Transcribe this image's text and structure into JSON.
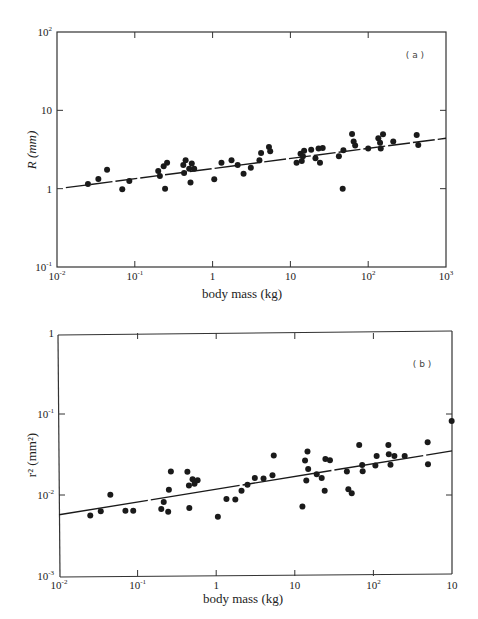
{
  "chart_data": [
    {
      "type": "scatter",
      "panel": "(a)",
      "title": "",
      "xlabel": "body mass (kg)",
      "ylabel": "R (mm)",
      "xscale": "log",
      "yscale": "log",
      "xlim": [
        0.01,
        1000
      ],
      "ylim": [
        0.1,
        100
      ],
      "x_tick_labels": [
        "10⁻²",
        "10⁻¹",
        "1",
        "10",
        "10²",
        "10³"
      ],
      "y_tick_labels": [
        "10⁻¹",
        "1",
        "10",
        "10²"
      ],
      "grid": false,
      "fit_line": {
        "x": [
          0.013,
          1000
        ],
        "y": [
          1.03,
          4.4
        ],
        "style": "dashed"
      },
      "points": [
        [
          0.025,
          1.15
        ],
        [
          0.034,
          1.33
        ],
        [
          0.044,
          1.75
        ],
        [
          0.069,
          0.98
        ],
        [
          0.085,
          1.25
        ],
        [
          0.2,
          1.68
        ],
        [
          0.21,
          1.45
        ],
        [
          0.235,
          1.93
        ],
        [
          0.245,
          1.0
        ],
        [
          0.26,
          2.15
        ],
        [
          0.42,
          2.0
        ],
        [
          0.43,
          1.58
        ],
        [
          0.45,
          2.3
        ],
        [
          0.5,
          1.8
        ],
        [
          0.52,
          1.2
        ],
        [
          0.54,
          2.1
        ],
        [
          0.58,
          1.8
        ],
        [
          1.05,
          1.32
        ],
        [
          1.3,
          2.15
        ],
        [
          1.75,
          2.3
        ],
        [
          2.1,
          2.0
        ],
        [
          2.5,
          1.55
        ],
        [
          3.1,
          1.85
        ],
        [
          4.0,
          2.3
        ],
        [
          4.2,
          2.85
        ],
        [
          5.3,
          3.4
        ],
        [
          5.5,
          3.0
        ],
        [
          12.0,
          2.15
        ],
        [
          13.5,
          2.8
        ],
        [
          14.0,
          2.25
        ],
        [
          14.5,
          2.6
        ],
        [
          15.0,
          3.05
        ],
        [
          18.5,
          3.15
        ],
        [
          21.0,
          2.45
        ],
        [
          23.0,
          3.25
        ],
        [
          24.0,
          2.15
        ],
        [
          26.0,
          3.3
        ],
        [
          42.0,
          2.6
        ],
        [
          47.0,
          1.0
        ],
        [
          48.0,
          3.1
        ],
        [
          62.0,
          5.0
        ],
        [
          65.0,
          4.0
        ],
        [
          68.0,
          3.55
        ],
        [
          100.0,
          3.25
        ],
        [
          135.0,
          4.4
        ],
        [
          142.0,
          3.85
        ],
        [
          145.0,
          3.25
        ],
        [
          155.0,
          4.95
        ],
        [
          210.0,
          4.0
        ],
        [
          420.0,
          4.85
        ],
        [
          440.0,
          3.6
        ]
      ]
    },
    {
      "type": "scatter",
      "panel": "(b)",
      "title": "",
      "xlabel": "body mass (kg)",
      "ylabel": "r² (mm²)",
      "xscale": "log",
      "yscale": "log",
      "xlim": [
        0.01,
        1000
      ],
      "ylim": [
        0.001,
        1
      ],
      "x_tick_labels": [
        "10⁻²",
        "10⁻¹",
        "1",
        "10",
        "10²",
        "10"
      ],
      "y_tick_labels": [
        "10⁻³",
        "10⁻²",
        "10⁻¹",
        "1"
      ],
      "grid": false,
      "fit_line": {
        "x": [
          0.01,
          1000
        ],
        "y": [
          0.0057,
          0.035
        ],
        "style": "solid"
      },
      "points": [
        [
          0.025,
          0.0056
        ],
        [
          0.034,
          0.0063
        ],
        [
          0.045,
          0.0101
        ],
        [
          0.07,
          0.0064
        ],
        [
          0.088,
          0.0064
        ],
        [
          0.2,
          0.0067
        ],
        [
          0.215,
          0.0082
        ],
        [
          0.245,
          0.0062
        ],
        [
          0.25,
          0.0116
        ],
        [
          0.265,
          0.0195
        ],
        [
          0.43,
          0.0193
        ],
        [
          0.45,
          0.0131
        ],
        [
          0.455,
          0.0069
        ],
        [
          0.5,
          0.0156
        ],
        [
          0.53,
          0.0138
        ],
        [
          0.58,
          0.0152
        ],
        [
          1.05,
          0.0054
        ],
        [
          1.35,
          0.0089
        ],
        [
          1.75,
          0.0088
        ],
        [
          2.1,
          0.0113
        ],
        [
          2.5,
          0.0134
        ],
        [
          3.1,
          0.0162
        ],
        [
          4.0,
          0.016
        ],
        [
          5.2,
          0.0175
        ],
        [
          5.4,
          0.0307
        ],
        [
          12.5,
          0.0072
        ],
        [
          13.5,
          0.0267
        ],
        [
          14.0,
          0.0151
        ],
        [
          14.5,
          0.0345
        ],
        [
          14.8,
          0.021
        ],
        [
          19.0,
          0.018
        ],
        [
          22.0,
          0.0162
        ],
        [
          24.0,
          0.0113
        ],
        [
          24.5,
          0.0278
        ],
        [
          28.0,
          0.0268
        ],
        [
          46.0,
          0.0195
        ],
        [
          48.0,
          0.0118
        ],
        [
          53.0,
          0.0105
        ],
        [
          66.0,
          0.0415
        ],
        [
          72.0,
          0.0235
        ],
        [
          73.0,
          0.0197
        ],
        [
          106.0,
          0.0231
        ],
        [
          110.0,
          0.0303
        ],
        [
          155.0,
          0.0415
        ],
        [
          157.0,
          0.0318
        ],
        [
          165.0,
          0.0237
        ],
        [
          185.0,
          0.0303
        ],
        [
          250.0,
          0.0303
        ],
        [
          490.0,
          0.0448
        ],
        [
          495.0,
          0.0239
        ],
        [
          990.0,
          0.0818
        ]
      ]
    }
  ],
  "panels": {
    "a": {
      "label": "( a )",
      "xlabel": "body mass (kg)",
      "ylabel": "R (mm)",
      "x_ticks": [
        "10",
        "10",
        "1",
        "10",
        "10",
        "10"
      ],
      "x_exps": [
        "-2",
        "-1",
        "",
        "",
        "2",
        "3"
      ],
      "y_ticks": [
        "10",
        "1",
        "10",
        "10"
      ],
      "y_exps": [
        "-1",
        "",
        "",
        "2"
      ]
    },
    "b": {
      "label": "( b )",
      "xlabel": "body mass (kg)",
      "ylabel": "r² (mm²)",
      "x_ticks": [
        "10",
        "10",
        "1",
        "10",
        "10",
        "10"
      ],
      "x_exps": [
        "-2",
        "-1",
        "",
        "",
        "2",
        ""
      ],
      "y_ticks": [
        "10",
        "10",
        "10",
        "1"
      ],
      "y_exps": [
        "-3",
        "-2",
        "-1",
        ""
      ]
    }
  },
  "colors": {
    "ink": "#1a1a1a",
    "axis": "#333333",
    "background": "#ffffff"
  }
}
